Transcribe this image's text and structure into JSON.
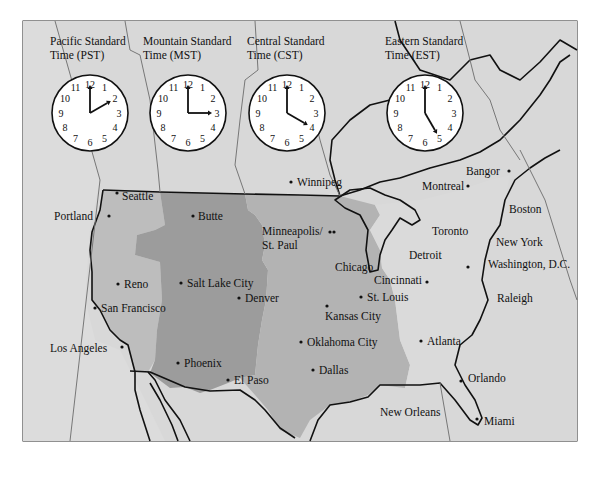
{
  "colors": {
    "background_land": "#d6d6d6",
    "pacific_us": "#bdbdbd",
    "mountain_us": "#9c9c9c",
    "central_us": "#b3b3b3",
    "eastern_us": "#d9d9d9",
    "border": "#111111",
    "clock_face": "#ffffff"
  },
  "time_zones": [
    {
      "id": "pst",
      "line1": "Pacific Standard",
      "line2": "Time (PST)",
      "clock_hour": 2,
      "clock_minute": 0
    },
    {
      "id": "mst",
      "line1": "Mountain Standard",
      "line2": "Time (MST)",
      "clock_hour": 3,
      "clock_minute": 0
    },
    {
      "id": "cst",
      "line1": "Central Standard",
      "line2": "Time (CST)",
      "clock_hour": 4,
      "clock_minute": 0
    },
    {
      "id": "est",
      "line1": "Eastern Standard",
      "line2": "Time (EST)",
      "clock_hour": 5,
      "clock_minute": 0
    }
  ],
  "clock_numerals": [
    "12",
    "1",
    "2",
    "3",
    "4",
    "5",
    "6",
    "7",
    "8",
    "9",
    "10",
    "11"
  ],
  "cities": [
    {
      "name": "Seattle",
      "zone": "pst"
    },
    {
      "name": "Portland",
      "zone": "pst"
    },
    {
      "name": "Reno",
      "zone": "pst"
    },
    {
      "name": "San Francisco",
      "zone": "pst"
    },
    {
      "name": "Los Angeles",
      "zone": "pst"
    },
    {
      "name": "Butte",
      "zone": "mst"
    },
    {
      "name": "Salt Lake City",
      "zone": "mst"
    },
    {
      "name": "Denver",
      "zone": "mst"
    },
    {
      "name": "Phoenix",
      "zone": "mst"
    },
    {
      "name": "El Paso",
      "zone": "mst"
    },
    {
      "name": "Winnipeg",
      "zone": "cst"
    },
    {
      "name": "Minneapolis/",
      "zone": "cst"
    },
    {
      "name": "St. Paul",
      "zone": "cst"
    },
    {
      "name": "Chicago",
      "zone": "cst"
    },
    {
      "name": "St. Louis",
      "zone": "cst"
    },
    {
      "name": "Kansas City",
      "zone": "cst"
    },
    {
      "name": "Oklahoma City",
      "zone": "cst"
    },
    {
      "name": "Dallas",
      "zone": "cst"
    },
    {
      "name": "New Orleans",
      "zone": "cst"
    },
    {
      "name": "Montreal",
      "zone": "est"
    },
    {
      "name": "Bangor",
      "zone": "est"
    },
    {
      "name": "Boston",
      "zone": "est"
    },
    {
      "name": "Toronto",
      "zone": "est"
    },
    {
      "name": "Detroit",
      "zone": "est"
    },
    {
      "name": "New York",
      "zone": "est"
    },
    {
      "name": "Cincinnati",
      "zone": "est"
    },
    {
      "name": "Washington, D.C.",
      "zone": "est"
    },
    {
      "name": "Raleigh",
      "zone": "est"
    },
    {
      "name": "Atlanta",
      "zone": "est"
    },
    {
      "name": "Orlando",
      "zone": "est"
    },
    {
      "name": "Miami",
      "zone": "est"
    }
  ]
}
